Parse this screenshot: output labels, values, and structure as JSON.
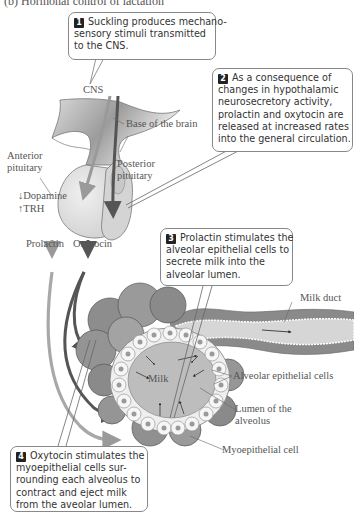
{
  "figure": {
    "title": "(b) Hormonal control of lactation"
  },
  "callouts": [
    {
      "number": "1",
      "lines": [
        "Suckling produces mechano-",
        "sensory stimuli transmitted",
        "to the CNS."
      ]
    },
    {
      "number": "2",
      "lines": [
        "As a consequence of",
        "changes in hypothalamic",
        "neurosecretory activity,",
        "prolactin and oxytocin are",
        "released at increased rates",
        "into the general circulation."
      ]
    },
    {
      "number": "3",
      "lines": [
        "Prolactin stimulates the",
        "alveolar epithelial cells to",
        "secrete milk into the",
        "alveolar lumen."
      ]
    },
    {
      "number": "4",
      "lines": [
        "Oxytocin stimulates the",
        "myoepithelial cells sur-",
        "rounding each alveolus to",
        "contract and eject milk",
        "from the aveolar lumen."
      ]
    }
  ],
  "labels": {
    "cns": "CNS",
    "base_of_brain": "Base of the brain",
    "anterior_pituitary_1": "Anterior",
    "anterior_pituitary_2": "pituitary",
    "posterior_pituitary_1": "Posterior",
    "posterior_pituitary_2": "pituitary",
    "dopamine": "↓Dopamine",
    "trh": "↑TRH",
    "prolactin": "Prolactin",
    "oxytocin": "Oxytocin",
    "milk_duct": "Milk duct",
    "milk": "Milk",
    "alveolar_epithelial_cells": "Alveolar epithelial cells",
    "lumen_1": "Lumen of the",
    "lumen_2": "alveolus",
    "myoepithelial_cell": "Myoepithelial cell"
  },
  "colors": {
    "prolactin_path": "#9a9a9a",
    "oxytocin_path": "#555555",
    "tissue_light": "#dcdcdc",
    "tissue_dark": "#8a8a8a",
    "callout_border": "#888888"
  }
}
